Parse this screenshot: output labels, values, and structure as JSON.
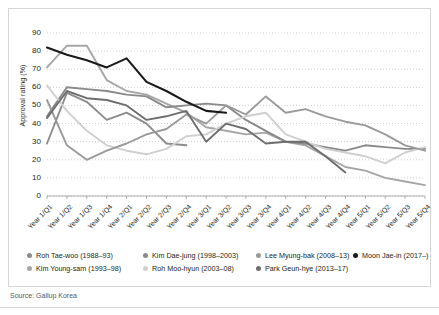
{
  "figure": {
    "source_note": "Source: Gallup Korea",
    "frame_color": "#d6d6d6"
  },
  "chart_data": {
    "type": "line",
    "title": "",
    "xlabel": "",
    "ylabel": "Approval rating (%)",
    "ylim": [
      0,
      90
    ],
    "yticks": [
      0,
      10,
      20,
      30,
      40,
      50,
      60,
      70,
      80,
      90
    ],
    "grid": true,
    "grid_style": "dotted-horizontal",
    "legend_position": "bottom",
    "categories": [
      "Year 1/Q1",
      "Year 1/Q2",
      "Year 1/Q3",
      "Year 1/Q4",
      "Year 2/Q1",
      "Year 2/Q2",
      "Year 2/Q3",
      "Year 2/Q4",
      "Year 3/Q1",
      "Year 3/Q2",
      "Year 3/Q3",
      "Year 3/Q4",
      "Year 4/Q1",
      "Year 4/Q2",
      "Year 4/Q3",
      "Year 4/Q4",
      "Year 5/Q1",
      "Year 5/Q2",
      "Year 5/Q3",
      "Year 5/Q4"
    ],
    "series": [
      {
        "name": "Roh Tae-woo (1988–93)",
        "color": "#8c8c8c",
        "values": [
          29,
          57,
          52,
          42,
          46,
          40,
          29,
          28,
          null,
          null,
          null,
          null,
          null,
          null,
          null,
          null,
          null,
          null,
          null,
          null
        ]
      },
      {
        "name": "Kim Young-sam (1993–98)",
        "color": "#a6a6a6",
        "values": [
          71,
          83,
          83,
          64,
          58,
          56,
          51,
          46,
          38,
          36,
          34,
          35,
          30,
          28,
          22,
          16,
          14,
          10,
          8,
          6
        ]
      },
      {
        "name": "Kim Dae-jung (1998–2003)",
        "color": "#8a8a8a",
        "values": [
          44,
          60,
          59,
          58,
          56,
          55,
          49,
          50,
          51,
          50,
          42,
          36,
          30,
          29,
          27,
          25,
          28,
          27,
          26,
          26
        ]
      },
      {
        "name": "Roh Moo-hyun (2003–08)",
        "color": "#cfcfcf",
        "values": [
          61,
          47,
          36,
          28,
          25,
          23,
          26,
          33,
          34,
          40,
          44,
          46,
          34,
          30,
          26,
          24,
          22,
          18,
          24,
          27
        ]
      },
      {
        "name": "Lee Myung-bak (2008–13)",
        "color": "#9a9a9a",
        "values": [
          53,
          28,
          20,
          25,
          29,
          34,
          37,
          45,
          40,
          50,
          45,
          55,
          46,
          48,
          44,
          41,
          39,
          34,
          28,
          25
        ]
      },
      {
        "name": "Park Geun-hye (2013–17)",
        "color": "#6e6e6e",
        "values": [
          43,
          58,
          54,
          53,
          50,
          42,
          44,
          47,
          30,
          40,
          37,
          29,
          30,
          30,
          22,
          13,
          null,
          null,
          null,
          null
        ]
      },
      {
        "name": "Moon Jae-in (2017–)",
        "color": "#1a1a1a",
        "values": [
          82,
          78,
          75,
          71,
          76,
          63,
          58,
          52,
          47,
          46,
          null,
          null,
          null,
          null,
          null,
          null,
          null,
          null,
          null,
          null
        ]
      }
    ]
  },
  "legend_columns": [
    {
      "left": 10,
      "items": [
        0,
        1
      ]
    },
    {
      "left": 126,
      "items": [
        2,
        3
      ]
    },
    {
      "left": 239,
      "items": [
        4,
        5
      ]
    },
    {
      "left": 336,
      "items": [
        6
      ]
    }
  ]
}
